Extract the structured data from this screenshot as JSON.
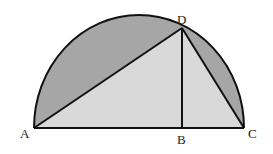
{
  "diagram": {
    "type": "geometry",
    "points": {
      "A": {
        "label": "A",
        "x": 34,
        "y": 128
      },
      "B": {
        "label": "B",
        "x": 182,
        "y": 128
      },
      "C": {
        "label": "C",
        "x": 244,
        "y": 128
      },
      "D": {
        "label": "D",
        "x": 182,
        "y": 28
      }
    },
    "segments": [
      "AC",
      "AD",
      "DC",
      "DB"
    ],
    "colors": {
      "segment_fill": "#a6a6a6",
      "triangle_fill": "#d9d9d9",
      "stroke": "#111111",
      "background": "#ffffff"
    }
  }
}
